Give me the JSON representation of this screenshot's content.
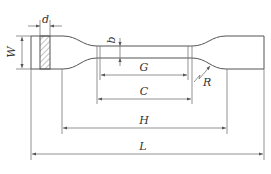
{
  "diagram": {
    "labels": {
      "d": "d",
      "W": "W",
      "b": "b",
      "G": "G",
      "C": "C",
      "R": "R",
      "H": "H",
      "L": "L"
    },
    "colors": {
      "outline": "#555555",
      "dimension": "#777777",
      "background": "#ffffff"
    }
  }
}
